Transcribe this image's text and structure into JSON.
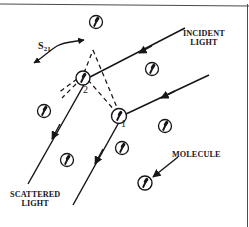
{
  "figure": {
    "background_color": "#ffffff",
    "stroke_color": "#16161a",
    "width": 249,
    "height": 227
  },
  "labels": {
    "incident_light": "INCIDENT\nLIGHT",
    "scattered_light": "SCATTERED\nLIGHT",
    "molecule": "MOLECULE",
    "separation_vector": "S",
    "separation_vector_subscript": "21",
    "molecule_1": "1",
    "molecule_2": "2"
  },
  "icons": {
    "molecule": "molecule-circle-with-dipole",
    "arrowhead": "solid-triangle-arrowhead",
    "double_arrow": "double-headed-curved-arrow"
  },
  "geometry": {
    "molecules": [
      {
        "id": "top",
        "cx": 96,
        "cy": 22,
        "r": 6.5,
        "dipole_angle": 20
      },
      {
        "id": "upper-right",
        "cx": 152,
        "cy": 69,
        "r": 6.5,
        "dipole_angle": 20
      },
      {
        "id": "scatterer-2",
        "cx": 83,
        "cy": 78,
        "r": 7,
        "dipole_angle": 20
      },
      {
        "id": "left",
        "cx": 44,
        "cy": 111,
        "r": 6.5,
        "dipole_angle": 20
      },
      {
        "id": "scatterer-1",
        "cx": 119,
        "cy": 116,
        "r": 7.5,
        "dipole_angle": 20
      },
      {
        "id": "mid-left",
        "cx": 67,
        "cy": 160,
        "r": 6.5,
        "dipole_angle": 20
      },
      {
        "id": "mid",
        "cx": 122,
        "cy": 148,
        "r": 6.5,
        "dipole_angle": 20
      },
      {
        "id": "right",
        "cx": 165,
        "cy": 126,
        "r": 6.5,
        "dipole_angle": 20
      },
      {
        "id": "bottom-right",
        "cx": 145,
        "cy": 183,
        "r": 7,
        "dipole_angle": 20
      }
    ],
    "incident_rays": [
      {
        "from": [
          183,
          29
        ],
        "to": [
          96,
          74
        ],
        "arrow_at": [
          143,
          51
        ]
      },
      {
        "from": [
          207,
          76
        ],
        "to": [
          127,
          114
        ],
        "arrow_at": [
          165,
          95
        ]
      }
    ],
    "scattered_rays": [
      {
        "from": [
          83,
          82
        ],
        "to": [
          29,
          182
        ],
        "arrow_at": [
          52,
          139
        ]
      },
      {
        "from": [
          118,
          123
        ],
        "to": [
          74,
          203
        ],
        "arrow_at": [
          96,
          163
        ]
      }
    ],
    "dashed_triangle": [
      [
        83,
        76
      ],
      [
        91,
        52
      ],
      [
        119,
        112
      ],
      [
        60,
        92
      ]
    ],
    "pointer_arrow": {
      "from": [
        176,
        158
      ],
      "to": [
        150,
        178
      ]
    },
    "frame": {
      "top_rule": true,
      "right_rule": true
    }
  }
}
